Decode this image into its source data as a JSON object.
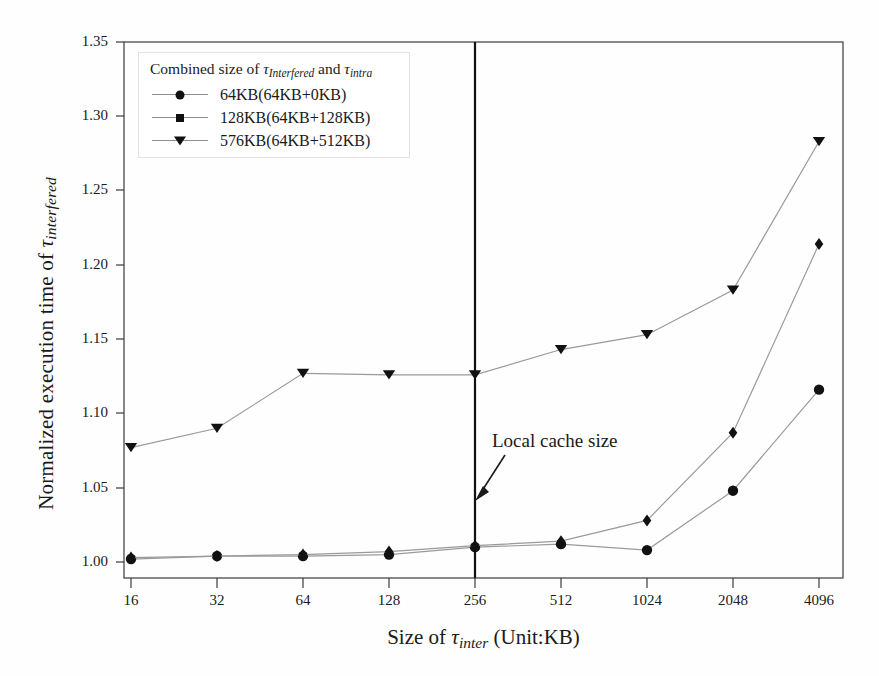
{
  "chart_data": {
    "type": "line",
    "title": "",
    "xlabel": "Size of τ_inter (Unit:KB)",
    "ylabel": "Normalized execution time of τ_interfered",
    "categories": [
      "16",
      "32",
      "64",
      "128",
      "256",
      "512",
      "1024",
      "2048",
      "4096"
    ],
    "xscale": "log2-categorical",
    "ylim": [
      1.0,
      1.35
    ],
    "yticks": [
      "1.00",
      "1.05",
      "1.10",
      "1.15",
      "1.20",
      "1.25",
      "1.30",
      "1.35"
    ],
    "ytick_values": [
      1.0,
      1.05,
      1.1,
      1.15,
      1.2,
      1.25,
      1.3,
      1.35
    ],
    "grid": false,
    "legend_position": "top-left",
    "legend_title": "Combined size of τ_interfered and τ_intra",
    "series": [
      {
        "name": "64KB(64KB+0KB)",
        "marker": "circle",
        "color": "#111111",
        "values": [
          1.002,
          1.004,
          1.004,
          1.005,
          1.01,
          1.012,
          1.008,
          1.048,
          1.116
        ]
      },
      {
        "name": "128KB(64KB+128KB)",
        "marker": "diamond",
        "color": "#111111",
        "values": [
          1.003,
          1.004,
          1.005,
          1.007,
          1.011,
          1.014,
          1.028,
          1.087,
          1.214
        ]
      },
      {
        "name": "576KB(64KB+512KB)",
        "marker": "triangle-down",
        "color": "#111111",
        "values": [
          1.077,
          1.09,
          1.127,
          1.126,
          1.126,
          1.143,
          1.153,
          1.183,
          1.283
        ]
      }
    ],
    "annotations": [
      {
        "text": "Local cache size",
        "type": "arrow-label",
        "points_to_category": "256"
      }
    ],
    "vertical_lines": [
      {
        "at_category": "256",
        "color": "#111111",
        "width": 2
      }
    ]
  },
  "axis": {
    "y_title_prefix": "Normalized execution time of ",
    "y_title_tau": "τ",
    "y_title_sub": "interfered",
    "x_title_prefix": "Size of ",
    "x_title_tau": "τ",
    "x_title_sub": "inter",
    "x_title_suffix": " (Unit:KB)"
  },
  "legend": {
    "title_prefix": "Combined size of ",
    "title_tau1": "τ",
    "title_sub1": "Interfered",
    "title_mid": " and ",
    "title_tau2": "τ",
    "title_sub2": "intra",
    "items": [
      {
        "label": "64KB(64KB+0KB)",
        "icon": "circle-marker-icon"
      },
      {
        "label": "128KB(64KB+128KB)",
        "icon": "diamond-marker-icon"
      },
      {
        "label": "576KB(64KB+512KB)",
        "icon": "triangle-down-marker-icon"
      }
    ]
  },
  "annotation": {
    "text": "Local cache size"
  },
  "style": {
    "axis_color": "#3a3a3a",
    "line_color": "#9a9a9a",
    "marker_color": "#111111",
    "vline_color": "#111111"
  }
}
